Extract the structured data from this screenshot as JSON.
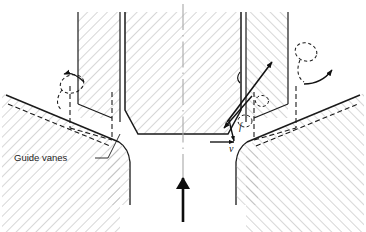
{
  "figure": {
    "type": "engineering-cross-section",
    "background_color": "#ffffff",
    "line_color": "#1a1a1a",
    "hatch_color": "#9a9a9a",
    "centerline_color": "#a8a8a8",
    "width": 366,
    "height": 232
  },
  "labels": {
    "guide_vanes": "Guide vanes",
    "velocity": "v",
    "force": "f",
    "u_symbol": "u"
  },
  "annotations": {
    "flow_arrow_direction": "upward",
    "left_vortex": "dashed-swirl",
    "right_vortex": "dashed-swirl",
    "left_curved_arrow": "counter-clockwise",
    "right_curved_arrow": "clockwise"
  },
  "geometry": {
    "centerline_x": 183,
    "hub_bottom_y": 134,
    "top_y": 12
  }
}
